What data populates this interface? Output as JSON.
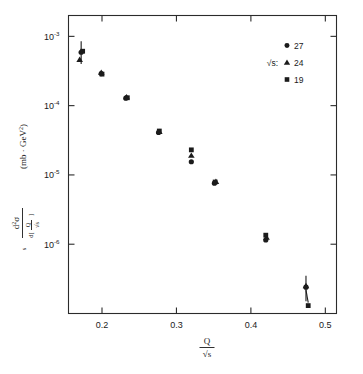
{
  "figure": {
    "background_color": "#ffffff",
    "foreground_color": "#1a1a1a"
  },
  "chart_data": {
    "type": "scatter",
    "title": "",
    "xlabel": "Q/√s",
    "ylabel": "s d²σ / d[Q/√s]  (mb · GeV²)",
    "xscale": "linear",
    "yscale": "log",
    "xlim": [
      0.155,
      0.515
    ],
    "ylim": [
      1e-07,
      0.002
    ],
    "grid": false,
    "legend_position": "top-right",
    "legend_title": "√s:",
    "xticks": [
      0.2,
      0.3,
      0.4,
      0.5
    ],
    "xtick_labels": [
      "0.2",
      "0.3",
      "0.4",
      "0.5"
    ],
    "yticks": [
      0.001,
      0.0001,
      1e-05,
      1e-06
    ],
    "ytick_labels": [
      "10⁻³",
      "10⁻⁴",
      "10⁻⁵",
      "10⁻⁶"
    ],
    "ytick_mantissa": "10",
    "ytick_exponents": [
      "-3",
      "-4",
      "-5",
      "-6"
    ],
    "series": [
      {
        "name": "27",
        "marker": "circle",
        "color": "#1b1b1b",
        "points": [
          {
            "x": 0.172,
            "y": 0.00059,
            "yerr_up": 0.00026,
            "yerr_dn": 0.00019
          },
          {
            "x": 0.199,
            "y": 0.00029
          },
          {
            "x": 0.232,
            "y": 0.000128
          },
          {
            "x": 0.276,
            "y": 4.1e-05
          },
          {
            "x": 0.32,
            "y": 1.55e-05
          },
          {
            "x": 0.351,
            "y": 7.6e-06
          },
          {
            "x": 0.42,
            "y": 1.15e-06
          },
          {
            "x": 0.474,
            "y": 2.4e-07,
            "yerr_up": 1.1e-07,
            "yerr_dn": 9e-08
          }
        ]
      },
      {
        "name": "24",
        "marker": "triangle",
        "color": "#1b1b1b",
        "points": [
          {
            "x": 0.17,
            "y": 0.00046
          },
          {
            "x": 0.199,
            "y": 0.0003
          },
          {
            "x": 0.233,
            "y": 0.000133
          },
          {
            "x": 0.277,
            "y": 4.2e-05
          },
          {
            "x": 0.32,
            "y": 1.9e-05
          },
          {
            "x": 0.353,
            "y": 8e-06
          },
          {
            "x": 0.421,
            "y": 1.25e-06
          },
          {
            "x": 0.474,
            "y": 2.5e-07
          }
        ]
      },
      {
        "name": "19",
        "marker": "square",
        "color": "#1b1b1b",
        "points": [
          {
            "x": 0.174,
            "y": 0.00061
          },
          {
            "x": 0.2,
            "y": 0.000285
          },
          {
            "x": 0.234,
            "y": 0.00013
          },
          {
            "x": 0.277,
            "y": 4.3e-05
          },
          {
            "x": 0.32,
            "y": 2.3e-05
          },
          {
            "x": 0.352,
            "y": 7.9e-06
          },
          {
            "x": 0.42,
            "y": 1.35e-06
          },
          {
            "x": 0.477,
            "y": 1.3e-07
          }
        ]
      }
    ],
    "annotations": [
      {
        "kind": "connector-line",
        "from": [
          0.474,
          2.4e-07
        ],
        "to": [
          0.477,
          1.3e-07
        ]
      }
    ]
  },
  "legend": {
    "label": "√s:",
    "entries": [
      {
        "marker": "circle",
        "text": "27"
      },
      {
        "marker": "triangle",
        "text": "24"
      },
      {
        "marker": "square",
        "text": "19"
      }
    ]
  },
  "ylabel_parts": {
    "s": "s",
    "numerator_d": "d",
    "numerator_sup": "2",
    "numerator_sigma": "σ",
    "denominator_d": "d[",
    "denominator_Q": "Q",
    "denominator_root": "√s",
    "denominator_close": "]",
    "units": "(mb · GeV",
    "units_sup": "2",
    "units_close": ")"
  },
  "xlabel_parts": {
    "numerator": "Q",
    "denominator": "√s"
  }
}
